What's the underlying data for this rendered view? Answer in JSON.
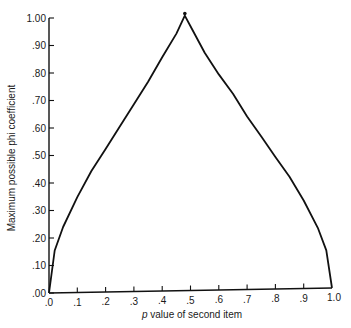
{
  "chart_data": {
    "type": "line",
    "title": "",
    "xlabel_italic": "p",
    "xlabel_rest": " value of second item",
    "xlabel": "p value of second item",
    "ylabel": "Maximum possible phi coefficient",
    "xlim": [
      0,
      1.0
    ],
    "ylim": [
      0,
      1.0
    ],
    "grid": false,
    "legend": null,
    "x_ticks": [
      ".0",
      ".1",
      ".2",
      ".3",
      ".4",
      ".5",
      ".6",
      ".7",
      ".8",
      ".9",
      "1.0"
    ],
    "y_ticks": [
      ".00",
      ".10",
      ".20",
      ".30",
      ".40",
      ".50",
      ".60",
      ".70",
      ".80",
      ".90",
      "1.00"
    ],
    "series": [
      {
        "name": "Maximum possible phi",
        "x": [
          0.0,
          0.02,
          0.05,
          0.1,
          0.15,
          0.2,
          0.25,
          0.3,
          0.35,
          0.4,
          0.45,
          0.48,
          0.5,
          0.55,
          0.6,
          0.65,
          0.7,
          0.75,
          0.8,
          0.85,
          0.9,
          0.95,
          0.98,
          1.0
        ],
        "values": [
          0.0,
          0.154,
          0.239,
          0.347,
          0.441,
          0.52,
          0.601,
          0.681,
          0.762,
          0.85,
          0.935,
          1.0,
          0.961,
          0.864,
          0.784,
          0.713,
          0.629,
          0.555,
          0.48,
          0.407,
          0.32,
          0.22,
          0.137,
          0.0
        ]
      }
    ],
    "peak": {
      "x": 0.48,
      "y": 1.0
    }
  }
}
